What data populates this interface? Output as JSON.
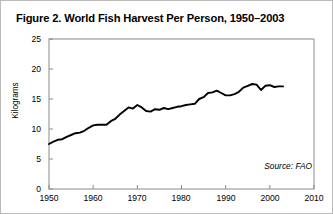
{
  "figure": {
    "title": "Figure 2. World Fish Harvest Per Person, 1950–2003",
    "source_note": "Source: FAO",
    "background_color": "#ffffff",
    "border_color": "#b9b9b9",
    "line_color": "#000000"
  },
  "chart_data": {
    "type": "line",
    "title": "Figure 2. World Fish Harvest Per Person, 1950–2003",
    "xlabel": "",
    "ylabel": "Kilograms",
    "xlim": [
      1950,
      2010
    ],
    "ylim": [
      0,
      25
    ],
    "grid": false,
    "legend": null,
    "annotations": [
      "Source: FAO"
    ],
    "xticks": [
      1950,
      1960,
      1970,
      1980,
      1990,
      2000,
      2010
    ],
    "yticks": [
      0,
      5,
      10,
      15,
      20,
      25
    ],
    "x": [
      1950,
      1951,
      1952,
      1953,
      1954,
      1955,
      1956,
      1957,
      1958,
      1959,
      1960,
      1961,
      1962,
      1963,
      1964,
      1965,
      1966,
      1967,
      1968,
      1969,
      1970,
      1971,
      1972,
      1973,
      1974,
      1975,
      1976,
      1977,
      1978,
      1979,
      1980,
      1981,
      1982,
      1983,
      1984,
      1985,
      1986,
      1987,
      1988,
      1989,
      1990,
      1991,
      1992,
      1993,
      1994,
      1995,
      1996,
      1997,
      1998,
      1999,
      2000,
      2001,
      2002,
      2003
    ],
    "values": [
      7.5,
      7.9,
      8.2,
      8.3,
      8.7,
      9.0,
      9.3,
      9.4,
      9.7,
      10.2,
      10.6,
      10.7,
      10.7,
      10.7,
      11.3,
      11.7,
      12.4,
      13.0,
      13.6,
      13.4,
      14.0,
      13.6,
      13.0,
      12.9,
      13.3,
      13.2,
      13.5,
      13.3,
      13.5,
      13.7,
      13.8,
      14.0,
      14.1,
      14.2,
      15.0,
      15.3,
      16.0,
      16.1,
      16.4,
      16.0,
      15.6,
      15.6,
      15.8,
      16.2,
      16.9,
      17.2,
      17.5,
      17.4,
      16.5,
      17.2,
      17.3,
      17.0,
      17.1,
      17.1
    ],
    "series": [
      {
        "name": "World fish harvest per person",
        "unit": "kilograms"
      }
    ]
  },
  "axes": {
    "y_tick_labels": [
      "25",
      "20",
      "15",
      "10",
      "5",
      "0"
    ],
    "x_tick_labels": [
      "1950",
      "1960",
      "1970",
      "1980",
      "1990",
      "2000",
      "2010"
    ],
    "y_axis_title": "Kilograms"
  }
}
